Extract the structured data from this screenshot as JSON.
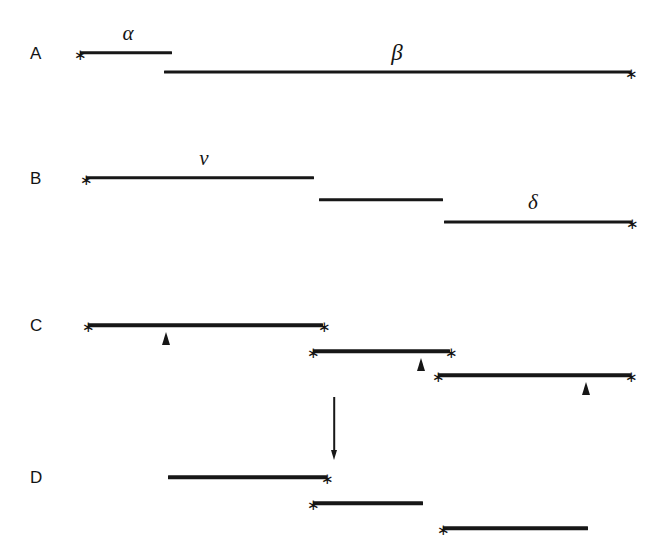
{
  "figure": {
    "width": 658,
    "height": 551,
    "background": "#ffffff",
    "ink_color": "#171717"
  },
  "panels": [
    {
      "id": "panel-a",
      "letter": "A",
      "letter_x": 30,
      "letter_y": 53,
      "segments": [
        {
          "name": "segment-alpha",
          "x1": 80,
          "x2": 172,
          "y": 53,
          "thickness": 3.4
        },
        {
          "name": "segment-beta",
          "x1": 164,
          "x2": 631,
          "y": 72,
          "thickness": 3.0
        }
      ],
      "labels": [
        {
          "name": "label-alpha",
          "text": "α",
          "x": 128,
          "y": 44,
          "size": 21
        },
        {
          "name": "label-beta",
          "text": "β",
          "x": 397,
          "y": 64,
          "size": 23
        }
      ],
      "stars": [
        {
          "name": "endpoint-star",
          "x": 80,
          "y": 53
        },
        {
          "name": "endpoint-star",
          "x": 631,
          "y": 72
        }
      ],
      "carets": [],
      "arrows": []
    },
    {
      "id": "panel-b",
      "letter": "B",
      "letter_x": 30,
      "letter_y": 178,
      "segments": [
        {
          "name": "segment-nu",
          "x1": 86,
          "x2": 314,
          "y": 178,
          "thickness": 3.4
        },
        {
          "name": "segment-b-middle",
          "x1": 319,
          "x2": 443,
          "y": 200,
          "thickness": 3.4
        },
        {
          "name": "segment-delta",
          "x1": 444,
          "x2": 632,
          "y": 222,
          "thickness": 3.2
        }
      ],
      "labels": [
        {
          "name": "label-nu",
          "text": "ν",
          "x": 204,
          "y": 169,
          "size": 21
        },
        {
          "name": "label-delta",
          "text": "δ",
          "x": 533,
          "y": 213,
          "size": 21
        }
      ],
      "stars": [
        {
          "name": "endpoint-star",
          "x": 86,
          "y": 178
        },
        {
          "name": "endpoint-star",
          "x": 632,
          "y": 222
        }
      ],
      "carets": [],
      "arrows": []
    },
    {
      "id": "panel-c",
      "letter": "C",
      "letter_x": 30,
      "letter_y": 325,
      "segments": [
        {
          "name": "segment-c1",
          "x1": 88,
          "x2": 323,
          "y": 325,
          "thickness": 3.6
        },
        {
          "name": "segment-c2",
          "x1": 313,
          "x2": 450,
          "y": 351,
          "thickness": 3.6
        },
        {
          "name": "segment-c3",
          "x1": 438,
          "x2": 631,
          "y": 375,
          "thickness": 3.6
        }
      ],
      "labels": [],
      "stars": [
        {
          "name": "endpoint-star",
          "x": 88,
          "y": 325
        },
        {
          "name": "endpoint-star",
          "x": 324,
          "y": 325
        },
        {
          "name": "endpoint-star",
          "x": 313,
          "y": 351
        },
        {
          "name": "endpoint-star",
          "x": 451,
          "y": 351
        },
        {
          "name": "endpoint-star",
          "x": 438,
          "y": 375
        },
        {
          "name": "endpoint-star",
          "x": 631,
          "y": 375
        }
      ],
      "carets": [
        {
          "name": "caret-marker",
          "x": 166,
          "y_top": 332
        },
        {
          "name": "caret-marker",
          "x": 421,
          "y_top": 358
        },
        {
          "name": "caret-marker",
          "x": 586,
          "y_top": 382
        }
      ],
      "arrows": [
        {
          "name": "downward-arrow",
          "x": 334,
          "y_top": 397,
          "y_bottom": 459
        }
      ]
    },
    {
      "id": "panel-d",
      "letter": "D",
      "letter_x": 30,
      "letter_y": 477,
      "segments": [
        {
          "name": "segment-d1",
          "x1": 168,
          "x2": 327,
          "y": 477,
          "thickness": 3.6
        },
        {
          "name": "segment-d2",
          "x1": 313,
          "x2": 423,
          "y": 503,
          "thickness": 3.6
        },
        {
          "name": "segment-d3",
          "x1": 443,
          "x2": 588,
          "y": 528,
          "thickness": 3.6
        }
      ],
      "labels": [],
      "stars": [
        {
          "name": "endpoint-star",
          "x": 327,
          "y": 477
        },
        {
          "name": "endpoint-star",
          "x": 313,
          "y": 503
        },
        {
          "name": "endpoint-star",
          "x": 443,
          "y": 528
        }
      ],
      "carets": [],
      "arrows": []
    }
  ]
}
